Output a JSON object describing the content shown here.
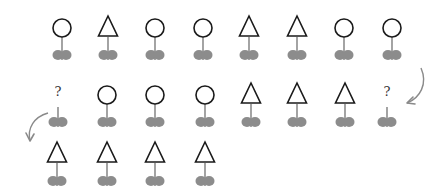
{
  "colors": {
    "outline": "#1a1a1a",
    "stem": "#9a9a9a",
    "leaves": "#8c8c8c",
    "arrow": "#8a8a8a",
    "question": "#333333"
  },
  "rows": [
    {
      "y": 12,
      "flowers": [
        {
          "x": 47,
          "head": "circle"
        },
        {
          "x": 93,
          "head": "triangle"
        },
        {
          "x": 140,
          "head": "circle"
        },
        {
          "x": 188,
          "head": "circle"
        },
        {
          "x": 234,
          "head": "triangle"
        },
        {
          "x": 282,
          "head": "triangle"
        },
        {
          "x": 329,
          "head": "circle"
        },
        {
          "x": 377,
          "head": "circle"
        }
      ]
    },
    {
      "y": 79,
      "flowers": [
        {
          "x": 43,
          "head": "question"
        },
        {
          "x": 92,
          "head": "circle"
        },
        {
          "x": 140,
          "head": "circle"
        },
        {
          "x": 190,
          "head": "circle"
        },
        {
          "x": 236,
          "head": "triangle"
        },
        {
          "x": 282,
          "head": "triangle"
        },
        {
          "x": 330,
          "head": "triangle"
        },
        {
          "x": 372,
          "head": "question"
        }
      ]
    },
    {
      "y": 138,
      "flowers": [
        {
          "x": 42,
          "head": "triangle"
        },
        {
          "x": 92,
          "head": "triangle"
        },
        {
          "x": 140,
          "head": "triangle"
        },
        {
          "x": 190,
          "head": "triangle"
        }
      ]
    }
  ],
  "labels": {
    "question_mark": "?"
  },
  "arrows": [
    {
      "name": "curved-arrow-right",
      "path": "M421 68 C 428 84, 420 98, 407 103",
      "head": "M407 103 L 413 97 M407 103 L 415 104"
    },
    {
      "name": "curved-arrow-left",
      "path": "M48 113 C 34 117, 27 128, 30 141",
      "head": "M30 141 L 26 133 M30 141 L 34 134"
    }
  ]
}
